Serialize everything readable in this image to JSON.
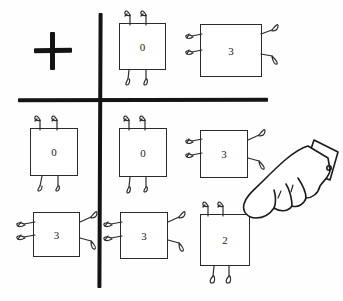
{
  "scene": {
    "title": "Hand-drawn puzzle grid with numbered creature tiles",
    "background_color": "#fefefe",
    "ink_color": "#141414"
  },
  "grid": {
    "divider_style": "cross",
    "vertical_divider": {
      "name": "vertical-divider"
    },
    "horizontal_divider": {
      "name": "horizontal-divider"
    },
    "columns": 3,
    "rows": 3
  },
  "plus_symbol": {
    "label": "+",
    "cell": "row-1-col-1"
  },
  "creatures": [
    {
      "id": "creature-r1c2",
      "digit": "0",
      "leg_orientation": "vertical",
      "cell": "row-1-col-2",
      "x": 119,
      "y": 23,
      "w": 47,
      "h": 47
    },
    {
      "id": "creature-r1c3",
      "digit": "3",
      "leg_orientation": "horizontal",
      "cell": "row-1-col-3",
      "x": 200,
      "y": 24,
      "w": 62,
      "h": 53
    },
    {
      "id": "creature-r2c1",
      "digit": "0",
      "leg_orientation": "vertical",
      "cell": "row-2-col-1",
      "x": 30,
      "y": 128,
      "w": 48,
      "h": 48
    },
    {
      "id": "creature-r2c2",
      "digit": "0",
      "leg_orientation": "vertical",
      "cell": "row-2-col-2",
      "x": 119,
      "y": 128,
      "w": 48,
      "h": 49
    },
    {
      "id": "creature-r2c3",
      "digit": "3",
      "leg_orientation": "horizontal",
      "cell": "row-2-col-3",
      "x": 200,
      "y": 130,
      "w": 48,
      "h": 48
    },
    {
      "id": "creature-r3c1",
      "digit": "3",
      "leg_orientation": "horizontal",
      "cell": "row-3-col-1",
      "x": 33,
      "y": 212,
      "w": 47,
      "h": 45
    },
    {
      "id": "creature-r3c2",
      "digit": "3",
      "leg_orientation": "horizontal",
      "cell": "row-3-col-2",
      "x": 120,
      "y": 212,
      "w": 48,
      "h": 47
    },
    {
      "id": "creature-r3c3",
      "digit": "2",
      "leg_orientation": "vertical",
      "cell": "row-3-col-3",
      "x": 200,
      "y": 214,
      "w": 50,
      "h": 52
    }
  ],
  "pointer": {
    "name": "pointing-hand-cursor",
    "target_creature": "creature-r3c3",
    "direction": "down-left"
  }
}
